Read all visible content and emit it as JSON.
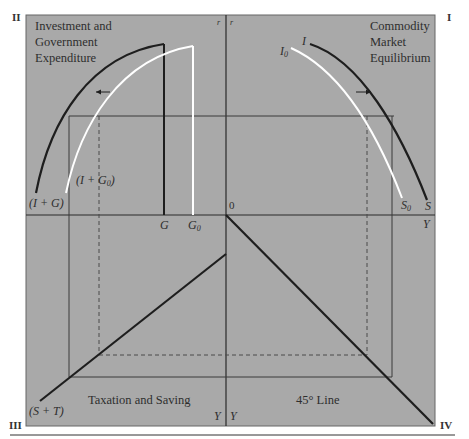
{
  "quadrants": {
    "q2": {
      "numeral": "II",
      "title_lines": [
        "Investment and",
        "Government",
        "Expenditure"
      ],
      "axis_label": "r",
      "curve_labels": {
        "black": "(I + G)",
        "white": "(I + G",
        "white_sub": "0",
        "white_close": ")"
      },
      "bar_labels": {
        "black": "G",
        "white": "G",
        "white_sub": "0"
      }
    },
    "q1": {
      "numeral": "I",
      "title_lines": [
        "Commodity",
        "Market",
        "Equilibrium"
      ],
      "axis_label": "r",
      "curve_labels": {
        "top_black": "I",
        "top_white": "I",
        "top_white_sub": "0",
        "bottom_black": "S",
        "bottom_white": "S",
        "bottom_white_sub": "0"
      },
      "x_axis_label": "Y"
    },
    "q3": {
      "numeral": "III",
      "title": "Taxation and Saving",
      "line_label": "(S + T)",
      "axis_label": "Y"
    },
    "q4": {
      "numeral": "IV",
      "title": "45° Line",
      "axis_label": "Y"
    }
  },
  "origin_label": "0",
  "colors": {
    "panel": "#a9a9a9",
    "ink": "#1e1e1e",
    "white_curve": "#ffffff",
    "frame": "#555555"
  }
}
